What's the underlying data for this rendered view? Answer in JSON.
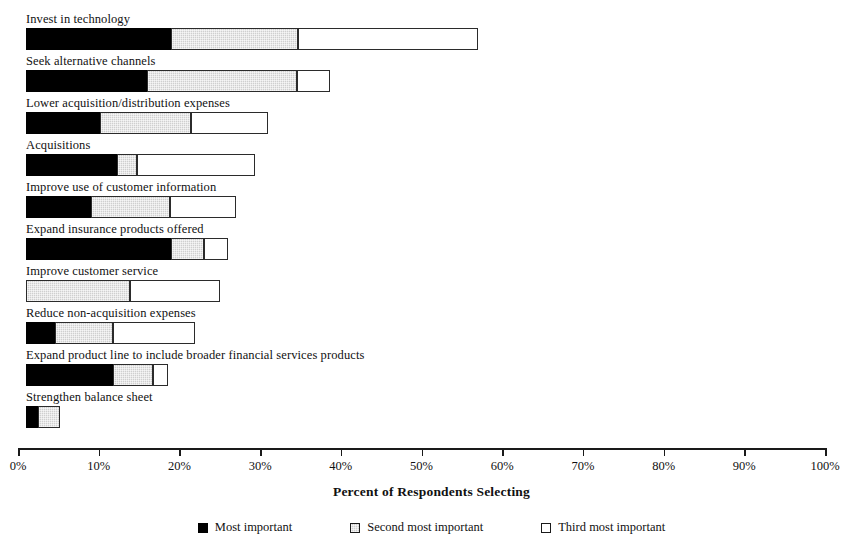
{
  "chart_data": {
    "type": "bar",
    "orientation": "horizontal",
    "stacked": true,
    "title": "",
    "xlabel": "Percent of Respondents Selecting",
    "ylabel": "",
    "xlim": [
      0,
      100
    ],
    "grid": false,
    "legend_position": "bottom",
    "tick_labels": [
      "0%",
      "10%",
      "20%",
      "30%",
      "40%",
      "50%",
      "60%",
      "70%",
      "80%",
      "90%",
      "100%"
    ],
    "tick_values": [
      0,
      10,
      20,
      30,
      40,
      50,
      60,
      70,
      80,
      90,
      100
    ],
    "categories": [
      "Invest in technology",
      "Seek alternative channels",
      "Lower acquisition/distribution expenses",
      "Acquisitions",
      "Improve use of customer information",
      "Expand insurance products offered",
      "Improve customer service",
      "Reduce non-acquisition expenses",
      "Expand product line to include broader financial services products",
      "Strengthen balance sheet"
    ],
    "series": [
      {
        "name": "Most important",
        "color": "#000000",
        "values": [
          18.0,
          15.0,
          9.2,
          11.3,
          8.0,
          18.0,
          0.0,
          3.6,
          10.8,
          1.5
        ]
      },
      {
        "name": "Second most important",
        "color": "#cfcfcf",
        "values": [
          15.7,
          18.6,
          11.2,
          2.5,
          9.9,
          4.0,
          12.9,
          7.2,
          4.9,
          2.7
        ]
      },
      {
        "name": "Third most important",
        "color": "#ffffff",
        "values": [
          22.3,
          4.1,
          9.6,
          14.6,
          8.1,
          3.0,
          11.1,
          10.2,
          1.9,
          0.0
        ]
      }
    ],
    "totals": [
      56.0,
      37.7,
      30.0,
      28.4,
      26.0,
      25.0,
      24.0,
      21.0,
      17.6,
      4.2
    ]
  },
  "legend": {
    "items": [
      {
        "label": "Most important",
        "swatch": "most"
      },
      {
        "label": "Second most important",
        "swatch": "second"
      },
      {
        "label": "Third most important",
        "swatch": "third"
      }
    ]
  }
}
